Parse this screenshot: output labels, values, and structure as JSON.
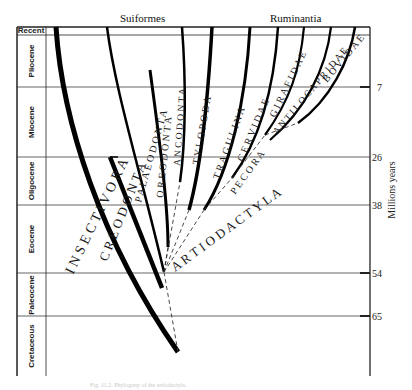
{
  "header": {
    "left_group": "Suiformes",
    "right_group": "Ruminantia"
  },
  "axis": {
    "title": "Millions years",
    "ticks": [
      {
        "label": "7",
        "y": 87
      },
      {
        "label": "26",
        "y": 157
      },
      {
        "label": "38",
        "y": 205
      },
      {
        "label": "54",
        "y": 273
      },
      {
        "label": "65",
        "y": 316
      }
    ]
  },
  "epochs": [
    {
      "label": "Recent",
      "top": 27,
      "bottom": 35
    },
    {
      "label": "Pliocene",
      "top": 35,
      "bottom": 87
    },
    {
      "label": "Miocene",
      "top": 87,
      "bottom": 157
    },
    {
      "label": "Oligocene",
      "top": 157,
      "bottom": 205
    },
    {
      "label": "Eocene",
      "top": 205,
      "bottom": 273
    },
    {
      "label": "Paleocene",
      "top": 273,
      "bottom": 316
    },
    {
      "label": "Cretaceous",
      "top": 316,
      "bottom": 376
    }
  ],
  "taxa": {
    "insectivora": "I N S E C T I V O R A",
    "creodonta": "C R E O D O N T A",
    "palaeodonta": "P A L A E O D O N T A",
    "oreodonta": "O R E O D O N T A",
    "ancodonta": "A N C O D O N T A",
    "tylopoda": "T Y L O P O D A",
    "tragulina": "T R A G U L I N A",
    "cervidae": "C E R V I D A E",
    "girafidae": "G I R A F I D A E",
    "antilocapridae": "A N T I L O C A P R I D A E",
    "bovidae": "B O V I D A E",
    "pecora": "P E C O R A",
    "artiodactyla": "A R T I O D A C T Y L A"
  },
  "caption": "Fig. 11.2. Phylogeny of the artiodactyls."
}
